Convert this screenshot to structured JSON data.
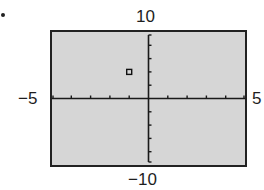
{
  "chart_data": {
    "type": "scatter",
    "title": "",
    "xlabel": "",
    "ylabel": "",
    "xlim": [
      -5,
      5
    ],
    "ylim": [
      -10,
      10
    ],
    "x_tick_step": 1,
    "y_tick_step": 2,
    "grid": false,
    "legend": null,
    "tick_labels": {
      "xmin": "−5",
      "xmax": "5",
      "ymin": "−10",
      "ymax": "10"
    },
    "points": [
      {
        "x": -1,
        "y": 4,
        "marker": "open-square"
      }
    ],
    "background": "#d6d6d6",
    "frame_color": "#222222"
  },
  "labels": {
    "ymax": "10",
    "ymin": "−10",
    "xmin": "−5",
    "xmax": "5"
  }
}
